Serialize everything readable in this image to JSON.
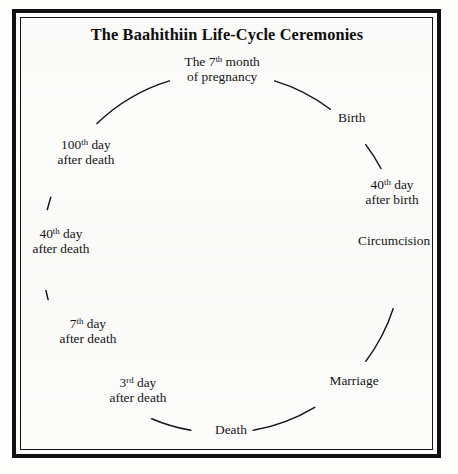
{
  "document": {
    "title": "The Baahithiin Life-Cycle Ceremonies",
    "type": "cycle-diagram"
  },
  "diagram": {
    "shape": "circle",
    "center_x": 222,
    "center_y": 253,
    "radius": 180,
    "line_color": "#141414",
    "background_color": "#fcfcfb",
    "border_color": "#111111",
    "direction": "clockwise",
    "nodes": [
      {
        "id": "pregnancy",
        "line1": "The 7",
        "sup": "th",
        "line1_rest": " month",
        "line2": "of pregnancy",
        "angle_deg": 270,
        "x": 222,
        "y": 69
      },
      {
        "id": "birth",
        "line1": "Birth",
        "sup": "",
        "line1_rest": "",
        "line2": "",
        "angle_deg": 315,
        "x": 352,
        "y": 118
      },
      {
        "id": "fortieth-day-after-birth",
        "line1": "40",
        "sup": "th",
        "line1_rest": " day",
        "line2": "after birth",
        "angle_deg": 345,
        "x": 392,
        "y": 192
      },
      {
        "id": "circumcision",
        "line1": "Circumcision",
        "sup": "",
        "line1_rest": "",
        "line2": "",
        "angle_deg": 5,
        "x": 394,
        "y": 241
      },
      {
        "id": "marriage",
        "line1": "Marriage",
        "sup": "",
        "line1_rest": "",
        "line2": "",
        "angle_deg": 48,
        "x": 354,
        "y": 381
      },
      {
        "id": "death",
        "line1": "Death",
        "sup": "",
        "line1_rest": "",
        "line2": "",
        "angle_deg": 90,
        "x": 231,
        "y": 430
      },
      {
        "id": "third-day-after-death",
        "line1": "3",
        "sup": "rd",
        "line1_rest": " day",
        "line2": "after death",
        "angle_deg": 126,
        "x": 138,
        "y": 390
      },
      {
        "id": "seventh-day-after-death",
        "line1": "7",
        "sup": "th",
        "line1_rest": " day",
        "line2": "after death",
        "angle_deg": 152,
        "x": 88,
        "y": 331
      },
      {
        "id": "fortieth-day-after-death",
        "line1": "40",
        "sup": "th",
        "line1_rest": " day",
        "line2": "after death",
        "angle_deg": 181,
        "x": 61,
        "y": 241
      },
      {
        "id": "hundredth-day-after-death",
        "line1": "100",
        "sup": "th",
        "line1_rest": " day",
        "line2": "after death",
        "angle_deg": 212,
        "x": 86,
        "y": 152
      }
    ]
  }
}
